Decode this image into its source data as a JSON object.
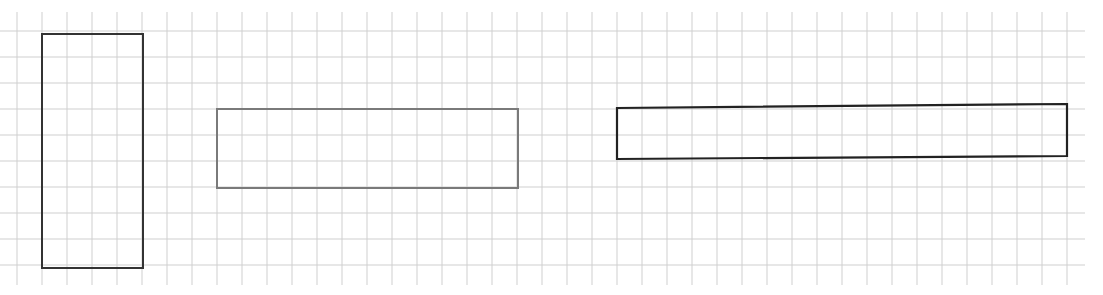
{
  "figure": {
    "background": "#ffffff",
    "grid": {
      "color": "#cfcfcf",
      "x_start": 0,
      "x_end": 1085,
      "y_start": 12,
      "y_end": 285,
      "vertical_lines": [
        17,
        42,
        67,
        92,
        117,
        142,
        167,
        192,
        217,
        242,
        267,
        292,
        317,
        342,
        367,
        392,
        417,
        442,
        467,
        492,
        517,
        542,
        567,
        592,
        617,
        642,
        667,
        692,
        717,
        742,
        767,
        792,
        817,
        842,
        867,
        892,
        917,
        942,
        967,
        992,
        1017,
        1042,
        1067
      ],
      "horizontal_lines": [
        31,
        57,
        83,
        109,
        135,
        161,
        187,
        213,
        239,
        265
      ]
    },
    "rectangles": [
      {
        "id": "tall-rectangle",
        "x": 42,
        "y": 34,
        "width": 101,
        "height": 234,
        "stroke": "#333333",
        "stroke_width": 2
      },
      {
        "id": "medium-rectangle",
        "x": 217,
        "y": 109,
        "width": 301,
        "height": 79,
        "stroke": "#7a7a7a",
        "stroke_width": 2
      },
      {
        "id": "long-rectangle",
        "points": "617,108 1067,104 1067,156 617,159",
        "stroke": "#222222",
        "stroke_width": 2.2
      }
    ]
  }
}
